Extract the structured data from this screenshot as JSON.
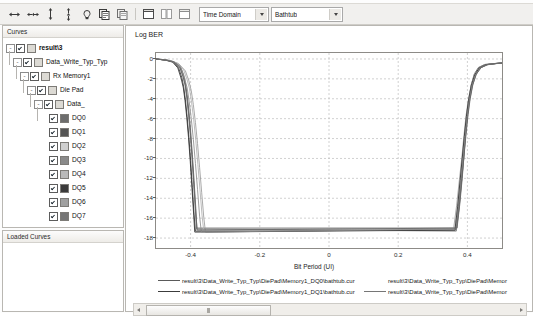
{
  "toolbar": {
    "icons": [
      {
        "name": "horizontal-cursor-icon",
        "glyph": "cursor-h"
      },
      {
        "name": "horizontal-delta-cursor-icon",
        "glyph": "cursor-hh"
      },
      {
        "name": "vertical-cursor-icon",
        "glyph": "cursor-v"
      },
      {
        "name": "vertical-delta-cursor-icon",
        "glyph": "cursor-vv"
      },
      {
        "name": "measure-icon",
        "glyph": "measure"
      },
      {
        "name": "copy-plot-icon",
        "glyph": "copy"
      },
      {
        "name": "copy-data-icon",
        "glyph": "copy2"
      },
      {
        "name": "new-window-icon",
        "glyph": "window"
      },
      {
        "name": "tile-window-icon",
        "glyph": "window-split"
      },
      {
        "name": "maximize-window-icon",
        "glyph": "window-max"
      }
    ],
    "domain_select": {
      "value": "Time Domain",
      "options": [
        "Time Domain",
        "Frequency Domain"
      ]
    },
    "plot_select": {
      "value": "Bathtub",
      "options": [
        "Bathtub",
        "Eye Diagram",
        "Waveform"
      ]
    }
  },
  "curves_panel": {
    "header": "Curves",
    "tree": [
      {
        "label": "result\\3",
        "depth": 0,
        "expander": "-",
        "checked": true,
        "swatch": "#dcdad4",
        "bold": true,
        "type": "folder"
      },
      {
        "label": "Data_Write_Typ_Typ",
        "depth": 1,
        "expander": "-",
        "checked": true,
        "swatch": "#dcdad4",
        "bold": false,
        "type": "folder"
      },
      {
        "label": "Rx Memory1",
        "depth": 2,
        "expander": "-",
        "checked": true,
        "swatch": "#dcdad4",
        "bold": false,
        "type": "folder"
      },
      {
        "label": "Die Pad",
        "depth": 3,
        "expander": "-",
        "checked": true,
        "swatch": "#dcdad4",
        "bold": false,
        "type": "folder"
      },
      {
        "label": "Data_",
        "depth": 4,
        "expander": "-",
        "checked": true,
        "swatch": "#dcdad4",
        "bold": false,
        "type": "folder"
      },
      {
        "label": "DQ0",
        "depth": 5,
        "expander": "",
        "checked": true,
        "swatch": "#6d6d6d",
        "bold": false,
        "type": "curve"
      },
      {
        "label": "DQ1",
        "depth": 5,
        "expander": "",
        "checked": true,
        "swatch": "#555555",
        "bold": false,
        "type": "curve"
      },
      {
        "label": "DQ2",
        "depth": 5,
        "expander": "",
        "checked": true,
        "swatch": "#cfcfcf",
        "bold": false,
        "type": "curve"
      },
      {
        "label": "DQ3",
        "depth": 5,
        "expander": "",
        "checked": true,
        "swatch": "#8a8a8a",
        "bold": false,
        "type": "curve"
      },
      {
        "label": "DQ4",
        "depth": 5,
        "expander": "",
        "checked": true,
        "swatch": "#b9b9b9",
        "bold": false,
        "type": "curve"
      },
      {
        "label": "DQ5",
        "depth": 5,
        "expander": "",
        "checked": true,
        "swatch": "#3b3b3b",
        "bold": false,
        "type": "curve"
      },
      {
        "label": "DQ6",
        "depth": 5,
        "expander": "",
        "checked": true,
        "swatch": "#a0a0a0",
        "bold": false,
        "type": "curve"
      },
      {
        "label": "DQ7",
        "depth": 5,
        "expander": "",
        "checked": true,
        "swatch": "#767676",
        "bold": false,
        "type": "curve"
      },
      {
        "label": "LDQS-LDQS#",
        "depth": 5,
        "expander": "",
        "checked": false,
        "swatch": "#c8c8c8",
        "bold": false,
        "type": "curve"
      },
      {
        "label": "Data0",
        "depth": 1,
        "expander": "+",
        "checked": false,
        "swatch": "#dcdad4",
        "bold": false,
        "type": "folder"
      }
    ]
  },
  "loaded_curves_panel": {
    "header": "Loaded Curves",
    "items": []
  },
  "chart_data": {
    "type": "line",
    "title": "Log BER",
    "xlabel": "Bit Period (UI)",
    "ylabel": "Log BER",
    "xlim": [
      -0.5,
      0.5
    ],
    "ylim": [
      -19,
      0.6
    ],
    "xticks": [
      -0.4,
      -0.2,
      0,
      0.2,
      0.4
    ],
    "yticks": [
      0,
      -2,
      -4,
      -6,
      -8,
      -10,
      -12,
      -14,
      -16,
      -18
    ],
    "grid": true,
    "legend_position": "bottom",
    "series": [
      {
        "name": "result\\3\\Data_Write_Typ_Typ\\DiePad\\Memory1_DQ0\\bathtub.cur",
        "color": "#5a5a5a",
        "x": [
          -0.5,
          -0.47,
          -0.45,
          -0.43,
          -0.42,
          -0.415,
          -0.41,
          -0.405,
          -0.4,
          -0.395,
          -0.39,
          -0.385,
          -0.382,
          0.37,
          0.378,
          0.385,
          0.39,
          0.395,
          0.4,
          0.405,
          0.412,
          0.42,
          0.432,
          0.45,
          0.48,
          0.5
        ],
        "y": [
          0,
          -0.1,
          -0.25,
          -0.7,
          -1.6,
          -2.4,
          -3.6,
          -5.2,
          -7.2,
          -9.6,
          -12.2,
          -15.0,
          -17.0,
          -17.0,
          -14.6,
          -12.0,
          -9.8,
          -7.6,
          -5.6,
          -4.0,
          -2.5,
          -1.5,
          -0.85,
          -0.55,
          -0.45,
          -0.4
        ]
      },
      {
        "name": "result\\3\\Data_Write_Typ_Typ\\DiePad\\Memory1_DQ1\\bathtub.cur",
        "color": "#3c3c3c",
        "x": [
          -0.5,
          -0.47,
          -0.45,
          -0.435,
          -0.425,
          -0.42,
          -0.415,
          -0.41,
          -0.405,
          -0.4,
          -0.395,
          -0.39,
          -0.386,
          0.366,
          0.374,
          0.381,
          0.387,
          0.393,
          0.399,
          0.405,
          0.413,
          0.423,
          0.436,
          0.455,
          0.482,
          0.5
        ],
        "y": [
          0,
          -0.12,
          -0.3,
          -0.85,
          -1.9,
          -2.8,
          -4.1,
          -5.8,
          -7.8,
          -10.2,
          -12.9,
          -15.6,
          -17.3,
          -17.2,
          -14.8,
          -12.2,
          -10.0,
          -7.8,
          -5.8,
          -4.2,
          -2.7,
          -1.6,
          -0.9,
          -0.58,
          -0.46,
          -0.41
        ]
      },
      {
        "name": "result\\3\\Data_Write_Typ_Typ\\DiePad\\Memory1_DQ2\\bathtub.cur",
        "color": "#9b9b9b",
        "x": [
          -0.5,
          -0.46,
          -0.435,
          -0.415,
          -0.405,
          -0.398,
          -0.392,
          -0.386,
          -0.38,
          -0.374,
          -0.368,
          -0.362,
          -0.357,
          0.36,
          0.369,
          0.377,
          0.384,
          0.39,
          0.396,
          0.403,
          0.411,
          0.421,
          0.435,
          0.456,
          0.484,
          0.5
        ],
        "y": [
          0,
          -0.15,
          -0.45,
          -1.2,
          -2.2,
          -3.2,
          -4.6,
          -6.4,
          -8.5,
          -10.9,
          -13.4,
          -15.9,
          -17.4,
          -17.1,
          -14.7,
          -12.1,
          -9.9,
          -7.7,
          -5.7,
          -4.1,
          -2.6,
          -1.55,
          -0.88,
          -0.56,
          -0.45,
          -0.4
        ]
      },
      {
        "name": "result\\3\\Data_Write_Typ_Typ\\DiePad\\Memory1_DQ3\\bathtub.cur",
        "color": "#767676",
        "x": [
          -0.5,
          -0.47,
          -0.45,
          -0.432,
          -0.422,
          -0.416,
          -0.411,
          -0.406,
          -0.401,
          -0.396,
          -0.391,
          -0.386,
          -0.383,
          0.368,
          0.376,
          0.383,
          0.389,
          0.394,
          0.4,
          0.406,
          0.414,
          0.424,
          0.437,
          0.457,
          0.483,
          0.5
        ],
        "y": [
          0,
          -0.11,
          -0.28,
          -0.78,
          -1.75,
          -2.6,
          -3.9,
          -5.5,
          -7.5,
          -9.9,
          -12.6,
          -15.3,
          -17.1,
          -17.3,
          -14.9,
          -12.3,
          -10.1,
          -7.9,
          -5.9,
          -4.3,
          -2.75,
          -1.65,
          -0.92,
          -0.59,
          -0.47,
          -0.42
        ]
      },
      {
        "name": "result\\3\\Data_Write_Typ_Typ\\DiePad\\Memory1_DQ4\\bathtub.cur",
        "color": "#b0b0b0",
        "x": [
          -0.5,
          -0.465,
          -0.44,
          -0.42,
          -0.41,
          -0.403,
          -0.397,
          -0.391,
          -0.385,
          -0.379,
          -0.373,
          -0.367,
          -0.362,
          0.363,
          0.372,
          0.38,
          0.386,
          0.392,
          0.398,
          0.404,
          0.412,
          0.422,
          0.436,
          0.456,
          0.484,
          0.5
        ],
        "y": [
          0,
          -0.14,
          -0.4,
          -1.1,
          -2.1,
          -3.0,
          -4.4,
          -6.1,
          -8.2,
          -10.6,
          -13.1,
          -15.7,
          -17.3,
          -17.0,
          -14.5,
          -11.9,
          -9.7,
          -7.5,
          -5.5,
          -3.9,
          -2.45,
          -1.48,
          -0.84,
          -0.54,
          -0.44,
          -0.39
        ]
      },
      {
        "name": "result\\3\\Data_Write_Typ_Typ\\DiePad\\Memory1_DQ5\\bathtub.cur",
        "color": "#2e2e2e",
        "x": [
          -0.5,
          -0.472,
          -0.452,
          -0.437,
          -0.427,
          -0.421,
          -0.416,
          -0.411,
          -0.406,
          -0.401,
          -0.396,
          -0.391,
          -0.388,
          0.364,
          0.372,
          0.379,
          0.385,
          0.391,
          0.397,
          0.403,
          0.411,
          0.421,
          0.434,
          0.454,
          0.481,
          0.5
        ],
        "y": [
          0,
          -0.13,
          -0.32,
          -0.9,
          -2.0,
          -2.9,
          -4.2,
          -5.9,
          -7.9,
          -10.3,
          -13.0,
          -15.7,
          -17.4,
          -17.2,
          -14.8,
          -12.2,
          -10.0,
          -7.8,
          -5.8,
          -4.2,
          -2.7,
          -1.6,
          -0.9,
          -0.57,
          -0.46,
          -0.41
        ]
      },
      {
        "name": "result\\3\\Data_Write_Typ_Typ\\DiePad\\Memory1_DQ6\\bathtub.cur",
        "color": "#8d8d8d",
        "x": [
          -0.5,
          -0.468,
          -0.445,
          -0.427,
          -0.417,
          -0.41,
          -0.404,
          -0.398,
          -0.392,
          -0.386,
          -0.38,
          -0.374,
          -0.369,
          0.367,
          0.375,
          0.382,
          0.388,
          0.394,
          0.4,
          0.406,
          0.414,
          0.424,
          0.438,
          0.458,
          0.485,
          0.5
        ],
        "y": [
          0,
          -0.13,
          -0.36,
          -1.0,
          -2.0,
          -2.9,
          -4.3,
          -6.0,
          -8.1,
          -10.5,
          -13.1,
          -15.8,
          -17.4,
          -17.1,
          -14.7,
          -12.1,
          -9.9,
          -7.7,
          -5.7,
          -4.1,
          -2.6,
          -1.55,
          -0.87,
          -0.56,
          -0.45,
          -0.4
        ]
      },
      {
        "name": "result\\3\\Data_Write_Typ_Typ\\DiePad\\Memory1_DQ7\\bathtub.cur",
        "color": "#646464",
        "x": [
          -0.5,
          -0.47,
          -0.448,
          -0.431,
          -0.421,
          -0.415,
          -0.41,
          -0.405,
          -0.4,
          -0.395,
          -0.39,
          -0.385,
          -0.381,
          0.369,
          0.377,
          0.384,
          0.39,
          0.396,
          0.402,
          0.408,
          0.416,
          0.426,
          0.44,
          0.46,
          0.486,
          0.5
        ],
        "y": [
          0,
          -0.12,
          -0.3,
          -0.82,
          -1.85,
          -2.7,
          -4.0,
          -5.7,
          -7.7,
          -10.1,
          -12.8,
          -15.5,
          -17.2,
          -17.0,
          -14.6,
          -12.0,
          -9.8,
          -7.6,
          -5.6,
          -4.0,
          -2.55,
          -1.52,
          -0.86,
          -0.55,
          -0.44,
          -0.4
        ]
      }
    ],
    "legend": [
      {
        "label": "result\\3\\Data_Write_Typ_Typ\\DiePad\\Memory1_DQ0\\bathtub.cur",
        "color": "#5a5a5a"
      },
      {
        "label": "result\\3\\Data_Write_Typ_Typ\\DiePad\\Memory1_DQ1\\bathtub.cur",
        "color": "#3c3c3c"
      },
      {
        "label": "result\\3\\Data_Write_Typ_Typ\\DiePad\\Memor",
        "color": "#9b9b9b"
      },
      {
        "label": "result\\3\\Data_Write_Typ_Typ\\DiePad\\Memor",
        "color": "#767676"
      }
    ]
  },
  "hscroll": {
    "left_arrow": "left-arrow",
    "right_arrow": "right-arrow"
  }
}
